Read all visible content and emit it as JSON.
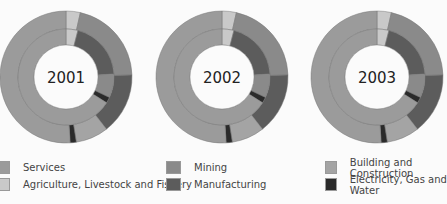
{
  "chart_data": {
    "type": "pie",
    "subtype": "nested-donut",
    "title": "",
    "charts": [
      {
        "label": "2001",
        "rings": [
          {
            "ring": "outer",
            "segments": [
              {
                "name": "Agriculture, Livestock and Fishery",
                "value": 3.5
              },
              {
                "name": "Mining",
                "value": 21
              },
              {
                "name": "Manufacturing",
                "value": 15
              },
              {
                "name": "Building and Construction",
                "value": 8
              },
              {
                "name": "Electricity, Gas and Water",
                "value": 1.5
              },
              {
                "name": "Services",
                "value": 51
              }
            ]
          },
          {
            "ring": "inner",
            "segments": [
              {
                "name": "Agriculture, Livestock and Fishery",
                "value": 4
              },
              {
                "name": "Manufacturing",
                "value": 20
              },
              {
                "name": "Mining",
                "value": 8
              },
              {
                "name": "Electricity, Gas and Water",
                "value": 2
              },
              {
                "name": "Services",
                "value": 66
              }
            ]
          }
        ]
      },
      {
        "label": "2002",
        "rings": [
          {
            "ring": "outer",
            "segments": [
              {
                "name": "Agriculture, Livestock and Fishery",
                "value": 3.5
              },
              {
                "name": "Mining",
                "value": 21
              },
              {
                "name": "Manufacturing",
                "value": 15
              },
              {
                "name": "Building and Construction",
                "value": 8
              },
              {
                "name": "Electricity, Gas and Water",
                "value": 1.5
              },
              {
                "name": "Services",
                "value": 51
              }
            ]
          },
          {
            "ring": "inner",
            "segments": [
              {
                "name": "Agriculture, Livestock and Fishery",
                "value": 4
              },
              {
                "name": "Manufacturing",
                "value": 20
              },
              {
                "name": "Mining",
                "value": 8
              },
              {
                "name": "Electricity, Gas and Water",
                "value": 2
              },
              {
                "name": "Services",
                "value": 66
              }
            ]
          }
        ]
      },
      {
        "label": "2003",
        "rings": [
          {
            "ring": "outer",
            "segments": [
              {
                "name": "Agriculture, Livestock and Fishery",
                "value": 3.5
              },
              {
                "name": "Mining",
                "value": 21
              },
              {
                "name": "Manufacturing",
                "value": 15
              },
              {
                "name": "Building and Construction",
                "value": 8
              },
              {
                "name": "Electricity, Gas and Water",
                "value": 1.5
              },
              {
                "name": "Services",
                "value": 51
              }
            ]
          },
          {
            "ring": "inner",
            "segments": [
              {
                "name": "Agriculture, Livestock and Fishery",
                "value": 4
              },
              {
                "name": "Manufacturing",
                "value": 20
              },
              {
                "name": "Mining",
                "value": 8
              },
              {
                "name": "Electricity, Gas and Water",
                "value": 2
              },
              {
                "name": "Services",
                "value": 66
              }
            ]
          }
        ]
      }
    ],
    "legend": [
      {
        "name": "Services",
        "color": "#9b9b9b"
      },
      {
        "name": "Agriculture, Livestock and Fishery",
        "color": "#c9c9c9"
      },
      {
        "name": "Mining",
        "color": "#8a8a8a"
      },
      {
        "name": "Manufacturing",
        "color": "#5c5c5c"
      },
      {
        "name": "Building and Construction",
        "color": "#a4a4a4"
      },
      {
        "name": "Electricity, Gas and Water",
        "color": "#2a2a2a"
      }
    ],
    "legend_position": "bottom"
  },
  "labels": {
    "y2001": "2001",
    "y2002": "2002",
    "y2003": "2003"
  },
  "legend": {
    "services": "Services",
    "agriculture": "Agriculture, Livestock and Fishery",
    "mining": "Mining",
    "manufacturing": "Manufacturing",
    "building": "Building and Construction",
    "electricity": "Electricity, Gas and Water"
  }
}
